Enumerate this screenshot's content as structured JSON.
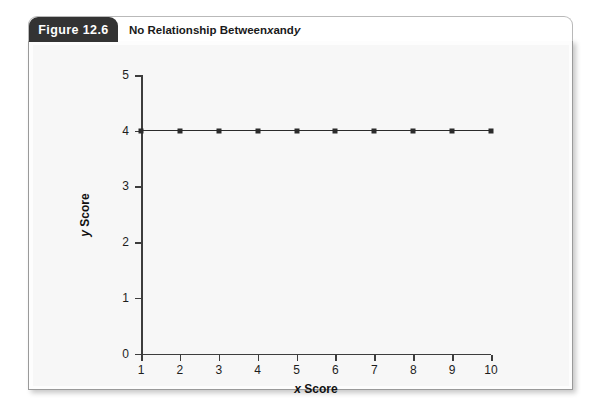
{
  "figure": {
    "tab_label": "Figure 12.6",
    "title_prefix": "No Relationship Between ",
    "title_x": "x",
    "title_mid": " and ",
    "title_y": "y"
  },
  "chart_data": {
    "type": "line",
    "title": "No Relationship Between x and y",
    "xlabel": "x Score",
    "ylabel": "y Score",
    "xlabel_italic": "x",
    "xlabel_rest": " Score",
    "ylabel_italic": "y",
    "ylabel_rest": " Score",
    "x": [
      1,
      2,
      3,
      4,
      5,
      6,
      7,
      8,
      9,
      10
    ],
    "values": [
      4,
      4,
      4,
      4,
      4,
      4,
      4,
      4,
      4,
      4
    ],
    "series": [
      {
        "name": "y Score",
        "values": [
          4,
          4,
          4,
          4,
          4,
          4,
          4,
          4,
          4,
          4
        ]
      }
    ],
    "xticks": [
      "1",
      "2",
      "3",
      "4",
      "5",
      "6",
      "7",
      "8",
      "9",
      "10"
    ],
    "yticks": [
      "0",
      "1",
      "2",
      "3",
      "4",
      "5"
    ],
    "xlim": [
      1,
      10
    ],
    "ylim": [
      0,
      5
    ],
    "grid": false,
    "legend": false,
    "marker": "square",
    "line_color": "#2b2b2b",
    "marker_color": "#2b2b2b",
    "plot_background": "#f7f7f7",
    "tab_background": "#333333"
  }
}
